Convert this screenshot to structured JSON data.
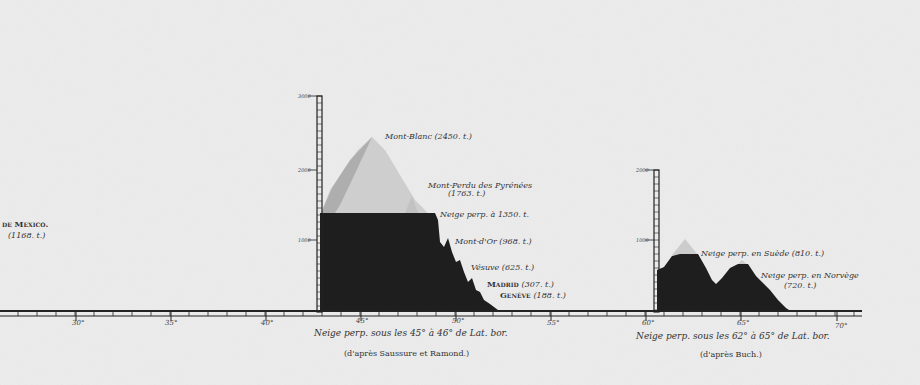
{
  "diagram": {
    "type": "elevation-profile",
    "units": "toises",
    "left_partial_label": {
      "name": "de Mexico.",
      "value": "(1168. t.)"
    },
    "x_axis": {
      "ticks": [
        "30°",
        "35°",
        "40°",
        "45°",
        "50°",
        "55°",
        "60°",
        "65°",
        "70°"
      ]
    },
    "panel_alps": {
      "y_ticks": [
        "3000",
        "2000",
        "1000"
      ],
      "snow_line_toises": 1350,
      "caption": "Neige perp. sous les 45° à 46° de Lat. bor.",
      "source": "(d'après Saussure et Ramond.)",
      "labels": [
        {
          "name": "Mont-Blanc",
          "value": "(2450. t.)",
          "toises": 2450
        },
        {
          "name": "Mont-Perdu des Pyrénées",
          "value": "(1763. t.)",
          "toises": 1763
        },
        {
          "name": "Neige perp. à 1350. t.",
          "value": "",
          "toises": 1350
        },
        {
          "name": "Mont-d'Or",
          "value": "(968. t.)",
          "toises": 968
        },
        {
          "name": "Vésuve",
          "value": "(625. t.)",
          "toises": 625
        },
        {
          "name": "Madrid",
          "value": "(307. t.)",
          "toises": 307
        },
        {
          "name": "Genève",
          "value": "(188. t.)",
          "toises": 188
        }
      ]
    },
    "panel_north": {
      "y_ticks": [
        "2000",
        "1000"
      ],
      "caption": "Neige perp. sous les 62° à 65° de Lat. bor.",
      "source": "(d'après Buch.)",
      "labels": [
        {
          "name": "Neige perp. en Suède",
          "value": "(810. t.)",
          "toises": 810
        },
        {
          "name": "Neige perp. en Norvège",
          "value": "(720. t.)",
          "toises": 720
        }
      ]
    }
  }
}
